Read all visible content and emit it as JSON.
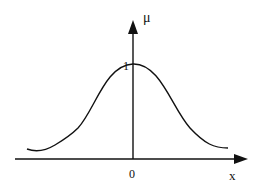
{
  "diagram": {
    "type": "bell-curve",
    "labels": {
      "y_axis": "μ",
      "x_axis": "x",
      "origin": "0",
      "peak_value": "1"
    },
    "colors": {
      "stroke": "#111111",
      "background": "#ffffff"
    }
  }
}
